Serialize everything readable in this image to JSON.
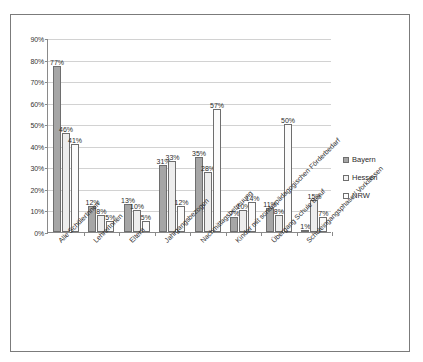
{
  "chart_data": {
    "type": "bar",
    "title": "",
    "xlabel": "",
    "ylabel": "",
    "ylim": [
      0,
      90
    ],
    "grid": true,
    "legend_position": "right",
    "ytick_labels": [
      "90%",
      "80%",
      "70%",
      "60%",
      "50%",
      "40%",
      "30%",
      "20%",
      "10%",
      "0%"
    ],
    "ytick_values": [
      90,
      80,
      70,
      60,
      50,
      40,
      30,
      20,
      10,
      0
    ],
    "categories": [
      "Alle SchülerInnen",
      "LehrerInnen",
      "Eltern",
      "Jahrgangsbezogen",
      "Nachmittagsbetreuung",
      "Kinder mit sonderpädagogischen Förderbedarf",
      "Übergang Schule Beruf",
      "Schuleingangsphase / Vorklassen"
    ],
    "series": [
      {
        "name": "Bayern",
        "color": "#a6a6a6",
        "values": [
          77,
          12,
          13,
          31,
          35,
          7,
          11,
          1
        ],
        "labels": [
          "77%",
          "12%",
          "13%",
          "31%",
          "35%",
          "7%",
          "11%",
          "1%"
        ]
      },
      {
        "name": "Hessen",
        "color": "#ededed",
        "values": [
          46,
          8,
          10,
          33,
          28,
          10,
          8,
          15
        ],
        "labels": [
          "46%",
          "8%",
          "10%",
          "33%",
          "28%",
          "10%",
          "8%",
          "15%"
        ]
      },
      {
        "name": "NRW",
        "color": "#fbfbfb",
        "values": [
          41,
          5,
          5,
          12,
          57,
          14,
          50,
          7
        ],
        "labels": [
          "41%",
          "5%",
          "5%",
          "12%",
          "57%",
          "14%",
          "50%",
          "7%"
        ]
      }
    ]
  },
  "legend": {
    "items": [
      {
        "label": "Bayern"
      },
      {
        "label": "Hessen"
      },
      {
        "label": "NRW"
      }
    ]
  }
}
